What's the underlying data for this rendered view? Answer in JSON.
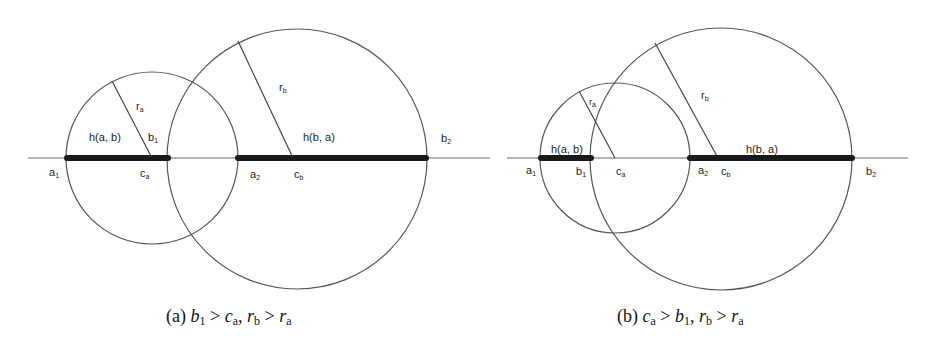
{
  "panels": [
    {
      "id": "a",
      "caption": {
        "prefix": "(a)",
        "parts": [
          {
            "var": "b",
            "sub": "1"
          },
          {
            "op": ">"
          },
          {
            "var": "c",
            "sub": "a"
          },
          {
            "op": ","
          },
          {
            "var": "r",
            "sub": "b"
          },
          {
            "op": ">"
          },
          {
            "var": "r",
            "sub": "a"
          }
        ],
        "text": "(a) b1 > ca, rb > ra"
      },
      "labels": {
        "h_ab": "h(a, b)",
        "h_ba": "h(b, a)",
        "a1": "a",
        "a1_sub": "1",
        "b1": "b",
        "b1_sub": "1",
        "a2": "a",
        "a2_sub": "2",
        "b2": "b",
        "b2_sub": "2",
        "ca": "c",
        "ca_sub": "a",
        "cb": "c",
        "cb_sub": "b",
        "ra": "r",
        "ra_sub": "a",
        "rb": "r",
        "rb_sub": "b"
      },
      "geometry": {
        "baseline_y": 158,
        "baseline_x": [
          28,
          490
        ],
        "circle_a": {
          "cx": 152,
          "cy": 158,
          "r": 86
        },
        "circle_b": {
          "cx": 297,
          "cy": 159,
          "r": 130
        },
        "segment_h_ab": [
          67,
          168
        ],
        "segment_h_ba": [
          238,
          426
        ]
      }
    },
    {
      "id": "b",
      "caption": {
        "prefix": "(b)",
        "parts": [
          {
            "var": "c",
            "sub": "a"
          },
          {
            "op": ">"
          },
          {
            "var": "b",
            "sub": "1"
          },
          {
            "op": ","
          },
          {
            "var": "r",
            "sub": "b"
          },
          {
            "op": ">"
          },
          {
            "var": "r",
            "sub": "a"
          }
        ],
        "text": "(b) ca > b1, rb > ra"
      },
      "labels": {
        "h_ab": "h(a, b)",
        "h_ba": "h(b, a)",
        "a1": "a",
        "a1_sub": "1",
        "b1": "b",
        "b1_sub": "1",
        "a2": "a",
        "a2_sub": "2",
        "b2": "b",
        "b2_sub": "2",
        "ca": "c",
        "ca_sub": "a",
        "cb": "c",
        "cb_sub": "b",
        "ra": "r",
        "ra_sub": "a",
        "rb": "r",
        "rb_sub": "b"
      },
      "geometry": {
        "baseline_y": 158,
        "baseline_x": [
          507,
          908
        ],
        "circle_a": {
          "cx": 615,
          "cy": 158,
          "r": 75
        },
        "circle_b": {
          "cx": 721,
          "cy": 159,
          "r": 131
        },
        "segment_h_ab": [
          541,
          591
        ],
        "segment_h_ba": [
          690,
          852
        ]
      }
    }
  ]
}
